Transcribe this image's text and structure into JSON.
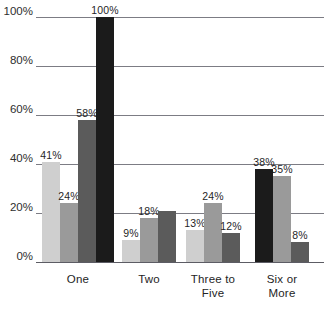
{
  "chart_data": {
    "type": "bar",
    "title": "",
    "subtitle": "",
    "xlabel": "",
    "ylabel": "",
    "ylim": [
      0,
      100
    ],
    "grid": true,
    "legend": "none",
    "value_suffix": "%",
    "categories": [
      "One",
      "Two",
      "Three to\nFive",
      "Six or\nMore"
    ],
    "y_ticks": [
      {
        "value": 0,
        "label": "0%"
      },
      {
        "value": 20,
        "label": "20%"
      },
      {
        "value": 40,
        "label": "40%"
      },
      {
        "value": 60,
        "label": "60%"
      },
      {
        "value": 80,
        "label": "80%"
      },
      {
        "value": 100,
        "label": "100%"
      }
    ],
    "series": [
      {
        "name": "series-1",
        "color": "#cfcfcf",
        "values": [
          41,
          9,
          13,
          null
        ]
      },
      {
        "name": "series-2",
        "color": "#9a9a9a",
        "values": [
          24,
          18,
          24,
          35
        ]
      },
      {
        "name": "series-3",
        "color": "#5b5b5b",
        "values": [
          58,
          21,
          12,
          8
        ]
      },
      {
        "name": "series-4",
        "color": "#1b1b1b",
        "values": [
          100,
          null,
          null,
          38
        ]
      }
    ],
    "groups": [
      {
        "category": "One",
        "label_line1": "One",
        "label_line2": "",
        "bars": [
          {
            "shade": 0,
            "value": 41,
            "label": "41%",
            "labeled": true
          },
          {
            "shade": 1,
            "value": 24,
            "label": "24%",
            "labeled": true
          },
          {
            "shade": 2,
            "value": 58,
            "label": "58%",
            "labeled": true
          },
          {
            "shade": 3,
            "value": 100,
            "label": "100%",
            "labeled": true
          }
        ]
      },
      {
        "category": "Two",
        "label_line1": "Two",
        "label_line2": "",
        "bars": [
          {
            "shade": 0,
            "value": 9,
            "label": "9%",
            "labeled": true
          },
          {
            "shade": 1,
            "value": 18,
            "label": "18%",
            "labeled": true
          },
          {
            "shade": 2,
            "value": 21,
            "label": "",
            "labeled": false
          }
        ]
      },
      {
        "category": "Three to Five",
        "label_line1": "Three to",
        "label_line2": "Five",
        "bars": [
          {
            "shade": 0,
            "value": 13,
            "label": "13%",
            "labeled": true
          },
          {
            "shade": 1,
            "value": 24,
            "label": "24%",
            "labeled": true
          },
          {
            "shade": 2,
            "value": 12,
            "label": "12%",
            "labeled": true
          }
        ]
      },
      {
        "category": "Six or More",
        "label_line1": "Six or",
        "label_line2": "More",
        "bars": [
          {
            "shade": 3,
            "value": 38,
            "label": "38%",
            "labeled": true
          },
          {
            "shade": 1,
            "value": 35,
            "label": "35%",
            "labeled": true
          },
          {
            "shade": 2,
            "value": 8,
            "label": "8%",
            "labeled": true
          }
        ]
      }
    ],
    "colors": {
      "shade_0": "#cfcfcf",
      "shade_1": "#9a9a9a",
      "shade_2": "#5b5b5b",
      "shade_3": "#1b1b1b",
      "gridline": "#7c7c84",
      "text": "#242424",
      "background": "#ffffff"
    }
  }
}
